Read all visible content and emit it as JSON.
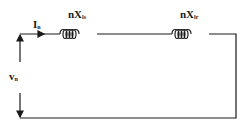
{
  "diagram": {
    "type": "equivalent-circuit",
    "colors": {
      "wire": "#1a1a1a",
      "background": "#ffffff"
    },
    "labels": {
      "current": {
        "main": "I",
        "sub": "n"
      },
      "voltage": {
        "main": "v",
        "sub": "n"
      },
      "inductor_stator": {
        "main": "nX",
        "sub": "ls"
      },
      "inductor_rotor": {
        "main": "nX",
        "sub": "lr"
      }
    },
    "components": [
      {
        "id": "inductor_stator",
        "kind": "inductor",
        "label": "nXls"
      },
      {
        "id": "inductor_rotor",
        "kind": "inductor",
        "label": "nXlr"
      }
    ]
  }
}
